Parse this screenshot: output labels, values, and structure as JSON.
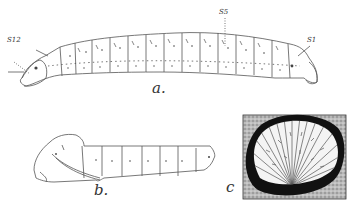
{
  "figure": {
    "panels": [
      {
        "id": "a",
        "label": "a.",
        "subject": "larva (lateral view)",
        "annotations": [
          "S12",
          "S5",
          "S1"
        ]
      },
      {
        "id": "b",
        "label": "b.",
        "subject": "pupa (lateral view)"
      },
      {
        "id": "c",
        "label": "c",
        "subject": "detail inset (fan-shaped structure in dark oval)"
      }
    ],
    "labels": {
      "a": "a.",
      "b": "b.",
      "c": "c",
      "s12": "S12",
      "s5": "S5",
      "s1": "S1"
    },
    "colors": {
      "line": "#555555",
      "ink": "#111111",
      "stipple": "#9a9a9a",
      "background": "#ffffff"
    }
  }
}
